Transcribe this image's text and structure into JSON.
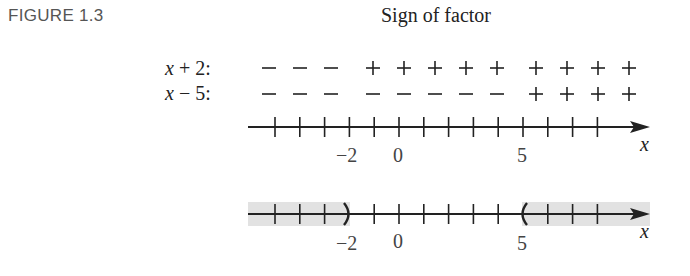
{
  "figure": {
    "label": "FIGURE 1.3",
    "title": "Sign of factor"
  },
  "sign_chart": {
    "rows": [
      {
        "label": "x + 2:",
        "signs": [
          "−",
          "−",
          "−",
          "+",
          "+",
          "+",
          "+",
          "+",
          "+",
          "+",
          "+",
          "+"
        ]
      },
      {
        "label": "x − 5:",
        "signs": [
          "−",
          "−",
          "−",
          "−",
          "−",
          "−",
          "−",
          "−",
          "+",
          "+",
          "+",
          "+"
        ]
      }
    ]
  },
  "number_line_top": {
    "tick_labels": [
      {
        "value": -2,
        "text": "−2"
      },
      {
        "value": 0,
        "text": "0"
      },
      {
        "value": 5,
        "text": "5"
      }
    ],
    "axis_label": "x"
  },
  "number_line_bottom": {
    "tick_labels": [
      {
        "value": -2,
        "text": "−2"
      },
      {
        "value": 0,
        "text": "0"
      },
      {
        "value": 5,
        "text": "5"
      }
    ],
    "axis_label": "x",
    "shaded_intervals": [
      {
        "from": "-inf",
        "to": -2,
        "open_end": ")"
      },
      {
        "from": 5,
        "to": "inf",
        "open_start": "("
      }
    ]
  },
  "colors": {
    "shade": "#e2e2e2",
    "ink": "#222222"
  }
}
